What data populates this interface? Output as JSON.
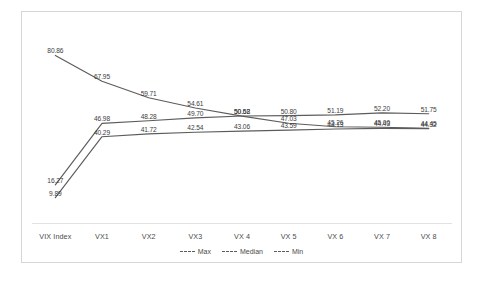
{
  "chart_data": {
    "type": "line",
    "title": "",
    "xlabel": "",
    "ylabel": "",
    "categories": [
      "VIX Index",
      "VX1",
      "VX2",
      "VX3",
      "VX 4",
      "VX 5",
      "VX 6",
      "VX 7",
      "VX 8"
    ],
    "ylim": [
      0,
      100
    ],
    "grid": false,
    "legend_position": "bottom-center",
    "data_labels": true,
    "series": [
      {
        "name": "Max",
        "color": "#5c5c5c",
        "values": [
          80.86,
          67.95,
          59.71,
          54.61,
          50.58,
          47.03,
          45.26,
          45.0,
          44.45
        ]
      },
      {
        "name": "Median",
        "color": "#5c5c5c",
        "values": [
          16.27,
          46.98,
          48.28,
          49.7,
          50.62,
          50.8,
          51.19,
          52.2,
          51.75
        ]
      },
      {
        "name": "Min",
        "color": "#5c5c5c",
        "values": [
          9.89,
          40.29,
          41.72,
          42.54,
          43.06,
          43.59,
          44.13,
          44.43,
          44.32
        ]
      }
    ]
  }
}
